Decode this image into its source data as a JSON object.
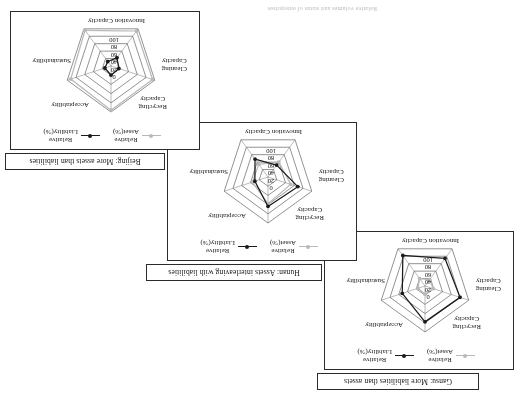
{
  "figure": {
    "caption": "Relative volumes and status of enterprises",
    "axes": [
      "Acceptability",
      "Sustainability",
      "Innovation Capacity",
      "Cleaning Capacity",
      "Recycling Capacity"
    ],
    "ticks": [
      "0",
      "20",
      "40",
      "60",
      "80",
      "100"
    ],
    "legend": {
      "asset": {
        "line1": "Relative",
        "line2": "Asset(%)",
        "color": "#b9b9b9"
      },
      "liability": {
        "line1": "Relative",
        "line2": "Liability(%)",
        "color": "#1a1a1a"
      }
    }
  },
  "panels": [
    {
      "id": "gansu",
      "title": "Gansu: More liabilities than assets",
      "chart_data": {
        "type": "radar",
        "title": "Gansu: More liabilities than assets",
        "categories": [
          "Acceptability",
          "Sustainability",
          "Innovation Capacity",
          "Cleaning Capacity",
          "Recycling Capacity"
        ],
        "rlim": [
          0,
          100
        ],
        "ticks": [
          0,
          20,
          40,
          60,
          80,
          100
        ],
        "grid": true,
        "legend_position": "top",
        "series": [
          {
            "name": "Relative Asset(%)",
            "color": "#b9b9b9",
            "values": [
              18,
              16,
              20,
              17,
              19
            ]
          },
          {
            "name": "Relative Liability(%)",
            "color": "#1a1a1a",
            "values": [
              78,
              52,
              82,
              74,
              80
            ]
          }
        ]
      }
    },
    {
      "id": "hunan",
      "title": "Hunan: Assets interleaving with liabilities",
      "chart_data": {
        "type": "radar",
        "title": "Hunan: Assets interleaving with liabilities",
        "categories": [
          "Acceptability",
          "Sustainability",
          "Innovation Capacity",
          "Cleaning Capacity",
          "Recycling Capacity"
        ],
        "rlim": [
          0,
          100
        ],
        "ticks": [
          0,
          20,
          40,
          60,
          80,
          100
        ],
        "grid": true,
        "legend_position": "top",
        "series": [
          {
            "name": "Relative Asset(%)",
            "color": "#b9b9b9",
            "values": [
              58,
              36,
              34,
              40,
              52
            ]
          },
          {
            "name": "Relative Liability(%)",
            "color": "#1a1a1a",
            "values": [
              64,
              30,
              48,
              32,
              68
            ]
          }
        ]
      }
    },
    {
      "id": "beijing",
      "title": "Beijing: More assets than liabilities",
      "chart_data": {
        "type": "radar",
        "title": "Beijing: More assets than liabilities",
        "categories": [
          "Acceptability",
          "Sustainability",
          "Innovation Capacity",
          "Cleaning Capacity",
          "Recycling Capacity"
        ],
        "rlim": [
          0,
          100
        ],
        "ticks": [
          0,
          20,
          40,
          60,
          80,
          100
        ],
        "grid": true,
        "legend_position": "top",
        "series": [
          {
            "name": "Relative Asset(%)",
            "color": "#b9b9b9",
            "values": [
              96,
              92,
              96,
              94,
              95
            ]
          },
          {
            "name": "Relative Liability(%)",
            "color": "#1a1a1a",
            "values": [
              20,
              14,
              12,
              22,
              18
            ]
          }
        ]
      }
    }
  ]
}
